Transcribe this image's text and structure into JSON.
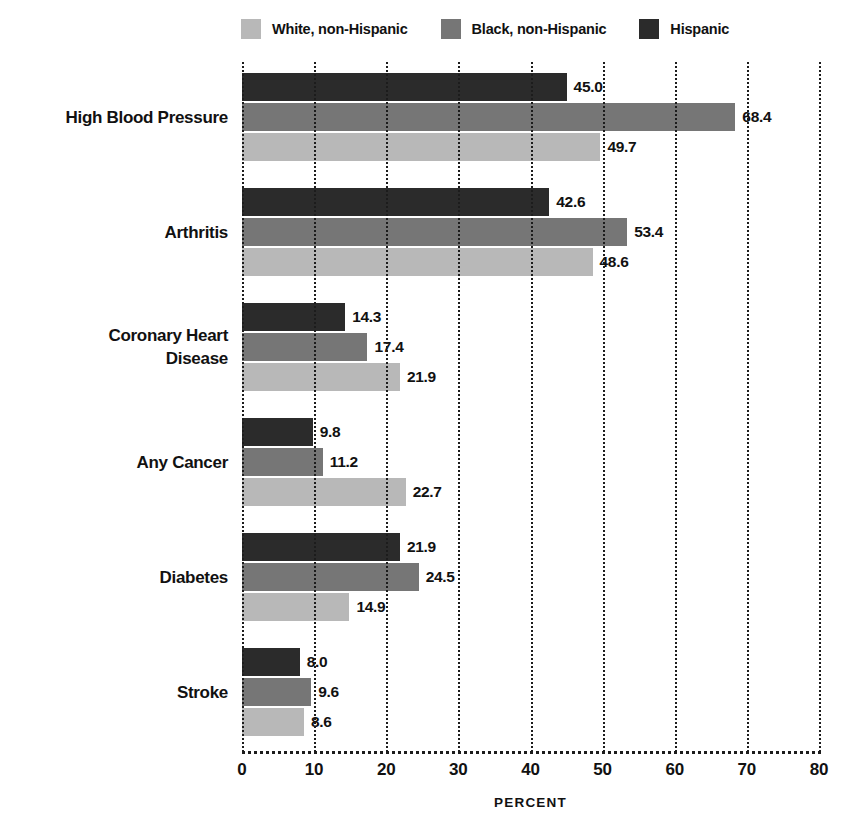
{
  "legend": {
    "items": [
      {
        "label": "White, non-Hispanic",
        "color": "#b8b8b8",
        "key": "white"
      },
      {
        "label": "Black, non-Hispanic",
        "color": "#767676",
        "key": "black"
      },
      {
        "label": "Hispanic",
        "color": "#2b2b2b",
        "key": "hispanic"
      }
    ]
  },
  "axis": {
    "title": "PERCENT",
    "ticks": [
      "0",
      "10",
      "20",
      "30",
      "40",
      "50",
      "60",
      "70",
      "80"
    ]
  },
  "categories": [
    {
      "lines": [
        "High Blood Pressure"
      ]
    },
    {
      "lines": [
        "Arthritis"
      ]
    },
    {
      "lines": [
        "Coronary Heart",
        "Disease"
      ]
    },
    {
      "lines": [
        "Any Cancer"
      ]
    },
    {
      "lines": [
        "Diabetes"
      ]
    },
    {
      "lines": [
        "Stroke"
      ]
    }
  ],
  "bar_labels": {
    "high_blood_pressure": {
      "hispanic": "45.0",
      "black": "68.4",
      "white": "49.7"
    },
    "arthritis": {
      "hispanic": "42.6",
      "black": "53.4",
      "white": "48.6"
    },
    "coronary_heart": {
      "hispanic": "14.3",
      "black": "17.4",
      "white": "21.9"
    },
    "any_cancer": {
      "hispanic": "9.8",
      "black": "11.2",
      "white": "22.7"
    },
    "diabetes": {
      "hispanic": "21.9",
      "black": "24.5",
      "white": "14.9"
    },
    "stroke": {
      "hispanic": "8.0",
      "black": "9.6",
      "white": "8.6"
    }
  },
  "chart_data": {
    "type": "bar",
    "orientation": "horizontal",
    "title": "",
    "xlabel": "PERCENT",
    "ylabel": "",
    "xlim": [
      0,
      80
    ],
    "xticks": [
      0,
      10,
      20,
      30,
      40,
      50,
      60,
      70,
      80
    ],
    "grid": "vertical-dotted",
    "legend_position": "top",
    "value_labels": true,
    "categories": [
      "High Blood Pressure",
      "Arthritis",
      "Coronary Heart Disease",
      "Any Cancer",
      "Diabetes",
      "Stroke"
    ],
    "series": [
      {
        "name": "White, non-Hispanic",
        "color": "#b8b8b8",
        "values": [
          49.7,
          48.6,
          21.9,
          22.7,
          14.9,
          8.6
        ]
      },
      {
        "name": "Black, non-Hispanic",
        "color": "#767676",
        "values": [
          68.4,
          53.4,
          17.4,
          11.2,
          24.5,
          9.6
        ]
      },
      {
        "name": "Hispanic",
        "color": "#2b2b2b",
        "values": [
          45.0,
          42.6,
          14.3,
          9.8,
          21.9,
          8.0
        ]
      }
    ]
  }
}
